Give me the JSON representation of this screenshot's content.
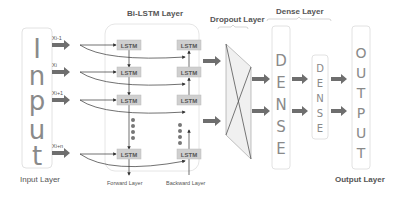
{
  "colors": {
    "arrow": "#6e6e6e",
    "lstm_fill": "#cfcfcf",
    "letter": "#8a8a8a",
    "border": "#e2e2e2",
    "dropout_fill": "#f0f0f0",
    "line": "#333333"
  },
  "input_layer": {
    "label": "Input Layer",
    "letters": [
      "I",
      "n",
      "p",
      "u",
      "t"
    ],
    "inputs": [
      "Xi-1",
      "Xi",
      "Xi+1",
      "Xi+n"
    ]
  },
  "bilstm_layer": {
    "title": "Bi-LSTM Layer",
    "cell_label": "LSTM",
    "forward_label": "Forward Layer",
    "backward_label": "Backward Layer"
  },
  "dropout_layer": {
    "title": "Dropout Layer"
  },
  "dense_layer": {
    "title": "Dense Layer",
    "letters_1": [
      "D",
      "E",
      "N",
      "S",
      "E"
    ],
    "letters_2": [
      "D",
      "E",
      "N",
      "S",
      "E"
    ]
  },
  "output_layer": {
    "label": "Output Layer",
    "letters": [
      "O",
      "U",
      "T",
      "P",
      "U",
      "T"
    ]
  }
}
